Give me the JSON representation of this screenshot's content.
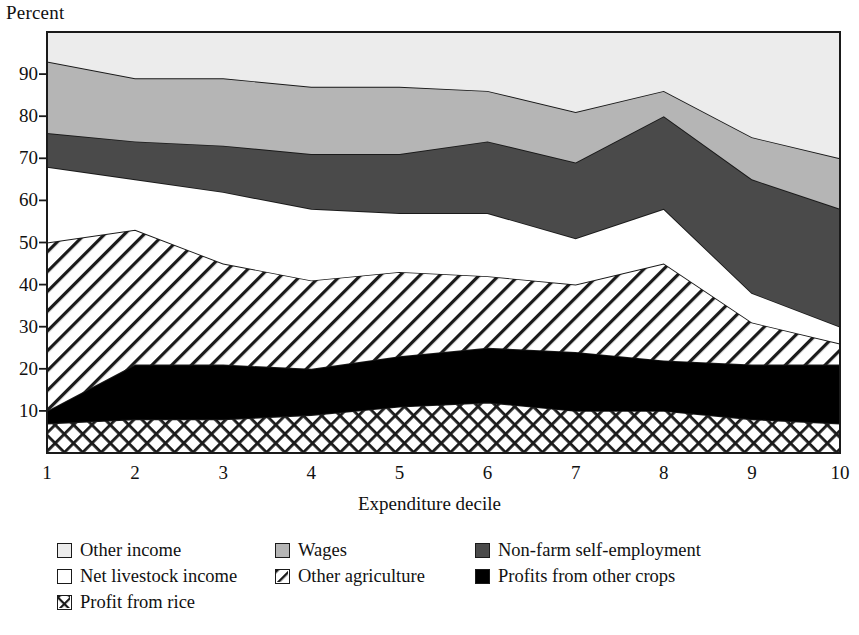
{
  "axes": {
    "ylabel": "Percent",
    "xlabel": "Expenditure decile",
    "yticks": [
      "10",
      "20",
      "30",
      "40",
      "50",
      "60",
      "70",
      "80",
      "90"
    ],
    "xticks": [
      "1",
      "2",
      "3",
      "4",
      "5",
      "6",
      "7",
      "8",
      "9",
      "10"
    ]
  },
  "legend": {
    "items": [
      {
        "key": "other_income",
        "label": "Other income",
        "swatch": "light-gray-square-swatch"
      },
      {
        "key": "wages",
        "label": "Wages",
        "swatch": "medium-gray-square-swatch"
      },
      {
        "key": "nonfarm",
        "label": "Non-farm self-employment",
        "swatch": "dark-gray-square-swatch"
      },
      {
        "key": "livestock",
        "label": "Net livestock income",
        "swatch": "white-square-swatch"
      },
      {
        "key": "other_agriculture",
        "label": "Other agriculture",
        "swatch": "diagonal-hatch-square-swatch"
      },
      {
        "key": "other_crops",
        "label": "Profits from other crops",
        "swatch": "black-square-swatch"
      },
      {
        "key": "rice",
        "label": "Profit from rice",
        "swatch": "cross-hatch-square-swatch"
      }
    ]
  },
  "colors": {
    "other_income": "#ececec",
    "wages": "#b5b5b5",
    "nonfarm": "#4a4a4a",
    "livestock": "#ffffff",
    "other_agriculture": "#ffffff",
    "other_crops": "#000000",
    "rice": "#ffffff",
    "outline": "#1a1a1a",
    "background": "#ffffff"
  },
  "chart_data": {
    "type": "area",
    "stacked": true,
    "title": "",
    "xlabel": "Expenditure decile",
    "ylabel": "Percent",
    "x": [
      1,
      2,
      3,
      4,
      5,
      6,
      7,
      8,
      9,
      10
    ],
    "categories": [
      "1",
      "2",
      "3",
      "4",
      "5",
      "6",
      "7",
      "8",
      "9",
      "10"
    ],
    "xlim": [
      1,
      10
    ],
    "ylim": [
      0,
      100
    ],
    "ytick_values": [
      10,
      20,
      30,
      40,
      50,
      60,
      70,
      80,
      90
    ],
    "grid": false,
    "legend_position": "below",
    "series": [
      {
        "name": "Profit from rice",
        "values": [
          7,
          8,
          8,
          9,
          11,
          12,
          10,
          10,
          8,
          7
        ]
      },
      {
        "name": "Profits from other crops",
        "values": [
          3,
          13,
          13,
          11,
          12,
          13,
          14,
          12,
          13,
          14
        ]
      },
      {
        "name": "Other agriculture",
        "values": [
          40,
          32,
          24,
          21,
          20,
          17,
          16,
          23,
          10,
          5
        ]
      },
      {
        "name": "Net livestock income",
        "values": [
          18,
          12,
          17,
          17,
          14,
          15,
          11,
          13,
          7,
          4
        ]
      },
      {
        "name": "Non-farm self-employment",
        "values": [
          8,
          9,
          11,
          13,
          14,
          17,
          18,
          22,
          27,
          28
        ]
      },
      {
        "name": "Wages",
        "values": [
          17,
          15,
          16,
          16,
          16,
          12,
          12,
          6,
          10,
          12
        ]
      },
      {
        "name": "Other income",
        "values": [
          7,
          11,
          11,
          13,
          13,
          14,
          19,
          14,
          25,
          30
        ]
      }
    ],
    "cumulative_tops": {
      "rice": [
        7,
        8,
        8,
        9,
        11,
        12,
        10,
        10,
        8,
        7
      ],
      "other_crops": [
        10,
        21,
        21,
        20,
        23,
        25,
        24,
        22,
        21,
        21
      ],
      "other_agriculture": [
        50,
        53,
        45,
        41,
        43,
        42,
        40,
        45,
        31,
        26
      ],
      "livestock": [
        68,
        65,
        62,
        58,
        57,
        57,
        51,
        58,
        38,
        30
      ],
      "nonfarm": [
        76,
        74,
        73,
        71,
        71,
        74,
        69,
        80,
        65,
        58
      ],
      "wages": [
        93,
        89,
        89,
        87,
        87,
        86,
        81,
        86,
        75,
        70
      ],
      "other_income": [
        100,
        100,
        100,
        100,
        100,
        100,
        100,
        100,
        100,
        100
      ]
    }
  },
  "plot_geometry": {
    "left": 47,
    "right": 840,
    "top": 32,
    "bottom": 453
  }
}
